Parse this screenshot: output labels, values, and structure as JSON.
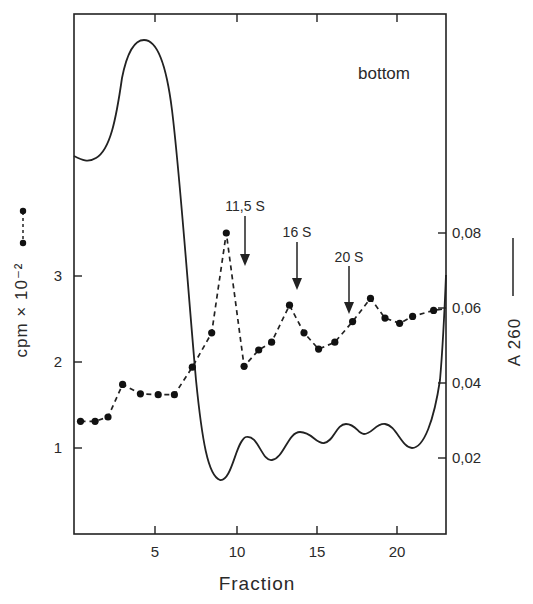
{
  "chart_data": {
    "type": "line",
    "title": "",
    "xlabel": "Fraction",
    "ylabel_left": "cpm × 10⁻²",
    "ylabel_right": "A 260",
    "x_ticks": [
      5,
      10,
      15,
      20
    ],
    "x_tick_labels": [
      "5",
      "10",
      "15",
      "20"
    ],
    "xlim": [
      0,
      23
    ],
    "y_left_ticks": [
      1,
      2,
      3
    ],
    "y_left_tick_labels": [
      "1",
      "2",
      "3"
    ],
    "ylim_left": [
      0,
      5.8
    ],
    "y_right_ticks": [
      0.02,
      0.04,
      0.06,
      0.08
    ],
    "y_right_tick_labels": [
      "0,02",
      "0,04",
      "0,06",
      "0,08"
    ],
    "ylim_right": [
      0,
      0.138
    ],
    "grid": false,
    "corner_annotation": "bottom",
    "legend": [
      {
        "label": "cpm × 10⁻²",
        "style": "dashed line with filled circles",
        "axis": "left"
      },
      {
        "label": "A 260",
        "style": "solid line",
        "axis": "right"
      }
    ],
    "annotations": [
      {
        "label": "11,5 S",
        "x": 10.5,
        "type": "down-arrow"
      },
      {
        "label": "16 S",
        "x": 13.8,
        "type": "down-arrow"
      },
      {
        "label": "20 S",
        "x": 16.9,
        "type": "down-arrow"
      }
    ],
    "series": [
      {
        "name": "cpm × 10⁻²",
        "axis": "left",
        "style": "dashed-markers",
        "x": [
          0.4,
          1.3,
          2.1,
          3.0,
          4.1,
          5.2,
          6.2,
          7.3,
          8.5,
          9.4,
          10.5,
          11.4,
          12.2,
          13.3,
          14.2,
          15.1,
          16.1,
          17.2,
          18.3,
          19.2,
          20.1,
          20.9,
          22.2
        ],
        "values": [
          1.31,
          1.31,
          1.36,
          1.74,
          1.63,
          1.62,
          1.62,
          1.94,
          2.34,
          3.5,
          1.95,
          2.14,
          2.23,
          2.66,
          2.34,
          2.15,
          2.23,
          2.47,
          2.74,
          2.51,
          2.45,
          2.53,
          2.6
        ]
      },
      {
        "name": "A 260",
        "axis": "right",
        "style": "solid",
        "x": [
          0,
          0.5,
          1.2,
          2.0,
          2.6,
          3.2,
          3.7,
          4.3,
          5.0,
          5.6,
          6.2,
          6.8,
          7.4,
          8.0,
          8.5,
          9.0,
          9.6,
          10.5,
          11.3,
          12.0,
          12.7,
          13.6,
          14.3,
          15.0,
          15.6,
          16.4,
          17.1,
          17.8,
          18.4,
          19.2,
          19.9,
          20.6,
          21.2,
          21.8,
          22.4,
          23.0
        ],
        "values": [
          0.101,
          0.099,
          0.1,
          0.114,
          0.13,
          0.138,
          0.14,
          0.137,
          0.122,
          0.1,
          0.072,
          0.05,
          0.033,
          0.02,
          0.016,
          0.015,
          0.02,
          0.028,
          0.027,
          0.022,
          0.024,
          0.03,
          0.029,
          0.026,
          0.027,
          0.031,
          0.031,
          0.029,
          0.031,
          0.031,
          0.027,
          0.023,
          0.025,
          0.033,
          0.048,
          0.068
        ]
      }
    ]
  }
}
